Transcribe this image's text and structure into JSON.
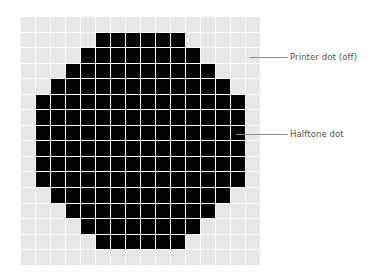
{
  "diagram": {
    "grid": {
      "columns": 16,
      "rows": 16,
      "colors": {
        "on": "#030303",
        "off": "#e7e7e7",
        "gap": "#ffffff"
      },
      "on_ranges_by_row": [
        null,
        [
          5,
          10
        ],
        [
          4,
          11
        ],
        [
          3,
          12
        ],
        [
          2,
          13
        ],
        [
          1,
          14
        ],
        [
          1,
          14
        ],
        [
          1,
          14
        ],
        [
          1,
          14
        ],
        [
          1,
          14
        ],
        [
          1,
          14
        ],
        [
          2,
          13
        ],
        [
          3,
          12
        ],
        [
          4,
          11
        ],
        [
          5,
          10
        ],
        null
      ]
    },
    "labels": [
      {
        "id": "printer-dot-off",
        "text": "Printer dot (off)",
        "leader": {
          "x1": 250,
          "x2": 288,
          "y": 57
        },
        "text_x": 290,
        "text_y": 52
      },
      {
        "id": "halftone-dot",
        "text": "Halftone dot",
        "leader": {
          "x1": 236,
          "x2": 288,
          "y": 134
        },
        "text_x": 290,
        "text_y": 129
      }
    ]
  }
}
